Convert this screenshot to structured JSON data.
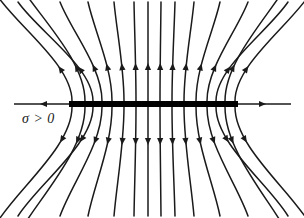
{
  "figure": {
    "name": "electric-field-of-uniformly-charged-infinite-plane",
    "background_color": "#ffffff",
    "width": 304,
    "height": 218,
    "line_color": "#1a1a1a",
    "plate_color": "#000000"
  },
  "annotations": {
    "charge_density_label": "σ > 0"
  },
  "plate": {
    "label": "charged-plane",
    "x_left": 69,
    "x_right": 238,
    "y_top": 101,
    "y_bottom": 107,
    "thickness": 6
  },
  "chart_data": {
    "type": "diagram",
    "title": "",
    "plate_center_x": 153.5,
    "plate_center_y": 104,
    "axis_lines": [
      {
        "name": "left-axis-arrow",
        "x1": 238,
        "y1": 104,
        "x2": 14,
        "y2": 104,
        "arrow_at": [
          40,
          104
        ],
        "arrow_angle": 180
      },
      {
        "name": "right-axis-arrow",
        "x1": 69,
        "y1": 104,
        "x2": 291,
        "y2": 104,
        "arrow_at": [
          266,
          104
        ],
        "arrow_angle": 0
      }
    ],
    "field_lines_top": [
      {
        "foot_x": 72,
        "end_x": -4,
        "end_y": -6,
        "bend": 0.95
      },
      {
        "foot_x": 85,
        "end_x": 10,
        "end_y": -30,
        "bend": 0.88
      },
      {
        "foot_x": 93,
        "end_x": 18,
        "end_y": 2,
        "bend": 0.8
      },
      {
        "foot_x": 102,
        "end_x": 60,
        "end_y": 2,
        "bend": 0.6
      },
      {
        "foot_x": 112,
        "end_x": 88,
        "end_y": 2,
        "bend": 0.42
      },
      {
        "foot_x": 124,
        "end_x": 114,
        "end_y": 2,
        "bend": 0.22
      },
      {
        "foot_x": 136,
        "end_x": 134,
        "end_y": 2,
        "bend": 0.08
      },
      {
        "foot_x": 148,
        "end_x": 148,
        "end_y": 2,
        "bend": 0.0
      },
      {
        "foot_x": 160,
        "end_x": 161,
        "end_y": 2,
        "bend": 0.0
      },
      {
        "foot_x": 172,
        "end_x": 175,
        "end_y": 2,
        "bend": -0.08
      },
      {
        "foot_x": 184,
        "end_x": 194,
        "end_y": 2,
        "bend": -0.22
      },
      {
        "foot_x": 196,
        "end_x": 220,
        "end_y": 2,
        "bend": -0.42
      },
      {
        "foot_x": 207,
        "end_x": 248,
        "end_y": 2,
        "bend": -0.6
      },
      {
        "foot_x": 216,
        "end_x": 288,
        "end_y": 2,
        "bend": -0.8
      },
      {
        "foot_x": 225,
        "end_x": 296,
        "end_y": -30,
        "bend": -0.88
      },
      {
        "foot_x": 235,
        "end_x": 310,
        "end_y": -6,
        "bend": -0.95
      }
    ],
    "arrow_distance_from_plate": 38,
    "symmetry": "mirror symmetric about the plate horizontally and vertically",
    "legend": [],
    "grid": false
  }
}
